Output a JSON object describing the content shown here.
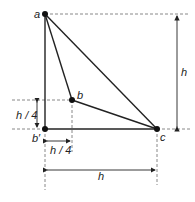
{
  "diagram": {
    "points": {
      "a": {
        "label": "a",
        "x": 45,
        "y": 14
      },
      "b": {
        "label": "b",
        "x": 72,
        "y": 100
      },
      "b_prime": {
        "label": "b′",
        "x": 45,
        "y": 129
      },
      "c": {
        "label": "c",
        "x": 157,
        "y": 129
      }
    },
    "dimensions": {
      "vertical_h": "h",
      "horizontal_h": "h",
      "vertical_quarter": "h / 4",
      "horizontal_quarter": "h / 4"
    },
    "colors": {
      "line": "#222222",
      "dashed": "#888888"
    }
  }
}
